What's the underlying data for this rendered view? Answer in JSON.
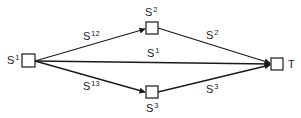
{
  "diagram": {
    "type": "flow-network",
    "colors": {
      "line": "#1a1a1a",
      "node_fill": "#ffffff",
      "background": "#ffffff"
    },
    "nodes": [
      {
        "id": "S1",
        "base": "S",
        "sup": "1",
        "label_position": "left"
      },
      {
        "id": "S2",
        "base": "S",
        "sup": "2",
        "label_position": "above"
      },
      {
        "id": "S3",
        "base": "S",
        "sup": "3",
        "label_position": "below"
      },
      {
        "id": "T",
        "base": "T",
        "sup": "",
        "label_position": "right"
      }
    ],
    "edges": [
      {
        "from": "S1",
        "to": "S2",
        "base": "S",
        "sup": "12"
      },
      {
        "from": "S1",
        "to": "T",
        "base": "S",
        "sup": "1"
      },
      {
        "from": "S1",
        "to": "S3",
        "base": "S",
        "sup": "13"
      },
      {
        "from": "S2",
        "to": "T",
        "base": "S",
        "sup": "2"
      },
      {
        "from": "S3",
        "to": "T",
        "base": "S",
        "sup": "3"
      }
    ]
  }
}
